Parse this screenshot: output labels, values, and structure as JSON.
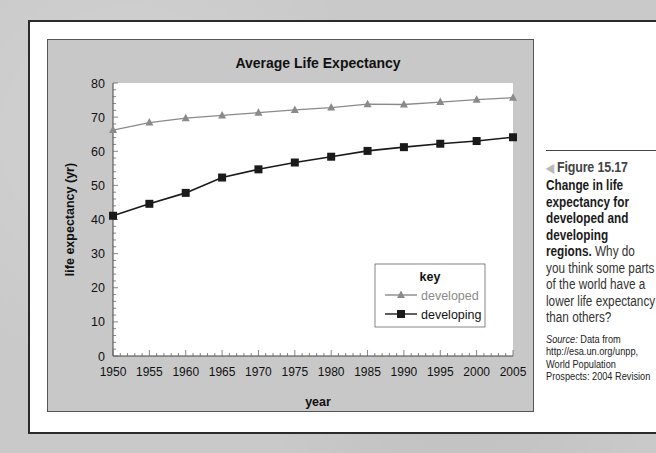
{
  "chart_data": {
    "type": "line",
    "title": "Average Life Expectancy",
    "xlabel": "year",
    "ylabel": "life expectancy (yr)",
    "x": [
      1950,
      1955,
      1960,
      1965,
      1970,
      1975,
      1980,
      1985,
      1990,
      1995,
      2000,
      2005
    ],
    "ylim": [
      0,
      80
    ],
    "yticks": [
      0,
      10,
      20,
      30,
      40,
      50,
      60,
      70,
      80
    ],
    "xticks": [
      1950,
      1955,
      1960,
      1965,
      1970,
      1975,
      1980,
      1985,
      1990,
      1995,
      2000,
      2005
    ],
    "grid": false,
    "legend": {
      "title": "key",
      "position": "lower right"
    },
    "series": [
      {
        "name": "developed",
        "marker": "triangle",
        "color": "#8a8a8a",
        "values": [
          66.2,
          68.4,
          69.7,
          70.5,
          71.3,
          72.1,
          72.8,
          73.8,
          73.7,
          74.4,
          75.1,
          75.7
        ]
      },
      {
        "name": "developing",
        "marker": "square",
        "color": "#1a1a1a",
        "values": [
          41.1,
          44.6,
          47.8,
          52.3,
          54.7,
          56.7,
          58.4,
          60.1,
          61.2,
          62.2,
          63.0,
          64.1
        ]
      }
    ]
  },
  "caption": {
    "figure_label": "Figure 15.17",
    "title": "Change in life expectancy for developed and developing regions.",
    "body": "Why do you think some parts of the world have a lower life expectancy than others?",
    "source_label": "Source:",
    "source_text": "Data from http://esa.un.org/unpp, World Population Prospects: 2004 Revision"
  }
}
